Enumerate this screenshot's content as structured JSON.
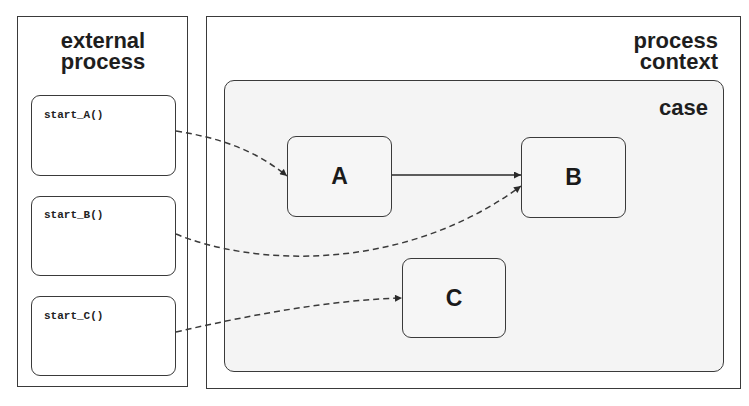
{
  "external_process": {
    "title_line1": "external",
    "title_line2": "process",
    "callers": [
      {
        "label": "start_A()",
        "target": "A"
      },
      {
        "label": "start_B()",
        "target": "B"
      },
      {
        "label": "start_C()",
        "target": "C"
      }
    ]
  },
  "process_context": {
    "title_line1": "process",
    "title_line2": "context",
    "case": {
      "title": "case",
      "states": [
        {
          "id": "A",
          "label": "A"
        },
        {
          "id": "B",
          "label": "B"
        },
        {
          "id": "C",
          "label": "C"
        }
      ]
    }
  },
  "edges": [
    {
      "from": "start_A()",
      "to": "A",
      "style": "dashed"
    },
    {
      "from": "start_B()",
      "to": "B",
      "style": "dashed"
    },
    {
      "from": "start_C()",
      "to": "C",
      "style": "dashed"
    },
    {
      "from": "A",
      "to": "B",
      "style": "solid"
    }
  ],
  "colors": {
    "stroke": "#3a3a3a",
    "case_fill": "#f4f4f4",
    "background": "#ffffff"
  }
}
